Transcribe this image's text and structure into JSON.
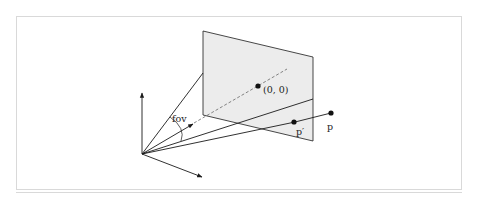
{
  "figure": {
    "labels": {
      "fov": "fov",
      "center": "(0, 0)",
      "projected_point": "p′",
      "point": "p"
    },
    "colors": {
      "plane_fill": "#ececec",
      "stroke": "#1a1a1a",
      "frame": "#d9d9d9"
    }
  }
}
